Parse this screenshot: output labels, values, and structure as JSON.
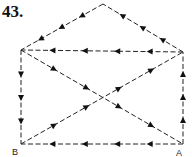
{
  "figure": {
    "number_label": "43.",
    "vertices": {
      "apex": {
        "x": 103,
        "y": 4
      },
      "top_left": {
        "x": 21,
        "y": 50
      },
      "top_right": {
        "x": 183,
        "y": 52
      },
      "B": {
        "x": 21,
        "y": 144,
        "label": "B"
      },
      "A": {
        "x": 183,
        "y": 144,
        "label": "A"
      }
    },
    "edges": [
      {
        "from": "apex",
        "to": "top_left",
        "arrows": 3,
        "direction": "toward top_left"
      },
      {
        "from": "top_right",
        "to": "apex",
        "arrows": 3,
        "direction": "toward apex"
      },
      {
        "from": "top_right",
        "to": "top_left",
        "arrows": 4,
        "direction": "left"
      },
      {
        "from": "top_left",
        "to": "B",
        "arrows": 3,
        "direction": "down"
      },
      {
        "from": "A",
        "to": "B",
        "arrows": 4,
        "direction": "left"
      },
      {
        "from": "A",
        "to": "top_right",
        "arrows": 3,
        "direction": "up"
      },
      {
        "from": "top_left",
        "to": "A",
        "arrows": 4,
        "direction": "down-right"
      },
      {
        "from": "B",
        "to": "top_right",
        "arrows": 4,
        "direction": "up-right"
      }
    ],
    "labels": {
      "A": "A",
      "B": "B"
    },
    "colors": {
      "line": "#222222",
      "arrow": "#111111",
      "background": "#ffffff"
    }
  }
}
